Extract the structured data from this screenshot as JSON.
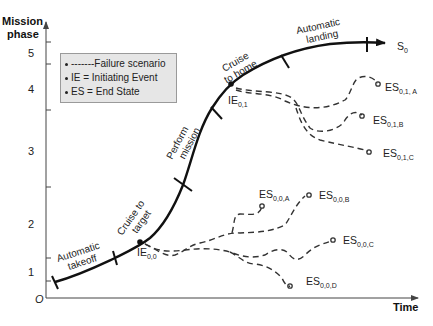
{
  "axes": {
    "y_title_line1": "Mission",
    "y_title_line2": "phase",
    "x_title": "Time",
    "origin": "O",
    "y_ticks": [
      "1",
      "2",
      "3",
      "4",
      "5"
    ]
  },
  "legend": {
    "items": [
      "-------Failure scenario",
      "IE = Initiating Event",
      "ES = End State"
    ]
  },
  "phases": [
    {
      "line1": "Automatic",
      "line2": "takeoff"
    },
    {
      "line1": "Cruise to",
      "line2": "target"
    },
    {
      "line1": "Perform",
      "line2": "mission"
    },
    {
      "line1": "Cruise",
      "line2": "to home"
    },
    {
      "line1": "Automatic",
      "line2": "landing"
    }
  ],
  "success_state": {
    "base": "S",
    "sub": "0"
  },
  "initiating_events": [
    {
      "base": "IE",
      "sub": "0,0"
    },
    {
      "base": "IE",
      "sub": "0,1"
    }
  ],
  "end_states": [
    {
      "base": "ES",
      "sub": "0,1, A"
    },
    {
      "base": "ES",
      "sub": "0,1,B"
    },
    {
      "base": "ES",
      "sub": "0,1,C"
    },
    {
      "base": "ES",
      "sub": "0,0,A"
    },
    {
      "base": "ES",
      "sub": "0,0,B"
    },
    {
      "base": "ES",
      "sub": "0,0,C"
    },
    {
      "base": "ES",
      "sub": "0,0,D"
    }
  ],
  "colors": {
    "curve": "#111111",
    "legend_bg": "#e6e6e6",
    "legend_border": "#9a9a9a"
  }
}
